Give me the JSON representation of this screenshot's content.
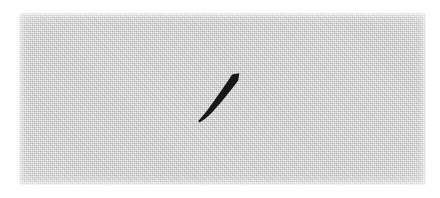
{
  "image": {
    "kind": "scanned-handwriting-sample",
    "width": 440,
    "height": 198,
    "background_color": "#ffffff",
    "alt_text": "A single curved black brush stroke on a light gray speckled scanned background"
  },
  "paper": {
    "name": "gray-paper-patch",
    "fill_color": "#cdcdcd",
    "texture": "halftone-dither-speckle",
    "left": 19,
    "top": 13,
    "width": 407,
    "height": 172,
    "label": ""
  },
  "ink": {
    "name": "curved-diagonal-stroke",
    "color": "#171717",
    "description": "single downward-left curving brush stroke, blunt cut at top-right, tapering to a point at lower-left",
    "start_point": [
      238,
      74
    ],
    "end_point": [
      199,
      121
    ],
    "bounding_box": [
      198,
      73,
      42,
      49
    ],
    "max_thickness": 8,
    "min_thickness": 3,
    "label": ""
  }
}
